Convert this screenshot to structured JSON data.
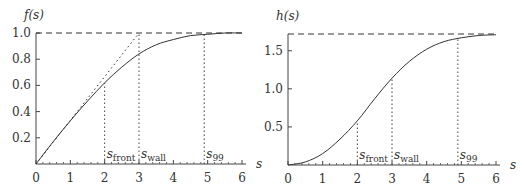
{
  "chart_data": [
    {
      "type": "line",
      "title": "",
      "ylabel": "f(s)",
      "xlabel": "s",
      "xlim": [
        0,
        6
      ],
      "ylim": [
        0,
        1.0
      ],
      "x_ticks": [
        "0",
        "1",
        "2",
        "3",
        "4",
        "5",
        "6"
      ],
      "y_ticks": [
        "0.2",
        "0.4",
        "0.6",
        "0.8",
        "1.0"
      ],
      "series": [
        {
          "name": "f(s)",
          "style": "solid",
          "x": [
            0,
            0.5,
            1,
            1.5,
            2,
            2.5,
            3,
            3.5,
            4,
            4.5,
            5,
            5.5,
            6
          ],
          "values": [
            0,
            0.17,
            0.33,
            0.48,
            0.62,
            0.74,
            0.84,
            0.91,
            0.95,
            0.98,
            0.99,
            1.0,
            1.0
          ]
        },
        {
          "name": "tangent",
          "style": "dotted",
          "x": [
            0,
            3
          ],
          "values": [
            0,
            1.0
          ]
        },
        {
          "name": "asymptote",
          "style": "dashed",
          "x": [
            0,
            6
          ],
          "values": [
            1.0,
            1.0
          ]
        }
      ],
      "markers": [
        {
          "label": "s",
          "sub": "front",
          "x": 2
        },
        {
          "label": "s",
          "sub": "wall",
          "x": 3
        },
        {
          "label": "s",
          "sub": "99",
          "x": 4.9
        }
      ]
    },
    {
      "type": "line",
      "title": "",
      "ylabel": "h(s)",
      "xlabel": "s",
      "xlim": [
        0,
        6
      ],
      "ylim": [
        0,
        1.72
      ],
      "x_ticks": [
        "0",
        "1",
        "2",
        "3",
        "4",
        "5",
        "6"
      ],
      "y_ticks": [
        "0.5",
        "1.0",
        "1.5"
      ],
      "series": [
        {
          "name": "h(s)",
          "style": "solid",
          "x": [
            0,
            0.5,
            1,
            1.5,
            2,
            2.5,
            3,
            3.5,
            4,
            4.5,
            5,
            5.5,
            6
          ],
          "values": [
            0,
            0.04,
            0.15,
            0.34,
            0.58,
            0.87,
            1.14,
            1.36,
            1.52,
            1.62,
            1.67,
            1.7,
            1.71
          ]
        },
        {
          "name": "asymptote",
          "style": "dashed",
          "x": [
            0,
            6
          ],
          "values": [
            1.72,
            1.72
          ]
        }
      ],
      "markers": [
        {
          "label": "s",
          "sub": "front",
          "x": 2
        },
        {
          "label": "s",
          "sub": "wall",
          "x": 3
        },
        {
          "label": "s",
          "sub": "99",
          "x": 4.9
        }
      ]
    }
  ]
}
